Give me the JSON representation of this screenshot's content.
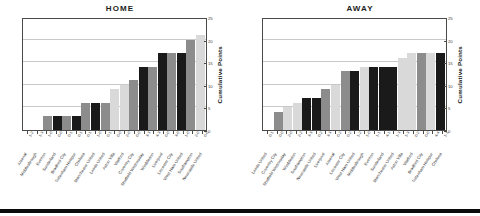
{
  "colors": {
    "bar_gray": "#8c8c8c",
    "bar_black": "#1a1a1a",
    "bar_light": "#d9d9d9",
    "axis": "#4a4a4a",
    "grid": "#c9c9c9",
    "text": "#1d1d1d"
  },
  "axis": {
    "y_label": "Cumulative Points",
    "y_ticks": [
      "0",
      "5",
      "10",
      "15",
      "20",
      "25"
    ]
  },
  "chart_data": [
    {
      "type": "bar",
      "title": "HOME",
      "xlabel": "",
      "ylabel": "Cumulative Points",
      "ylim": [
        0,
        25
      ],
      "grid": true,
      "legend": "none",
      "categories": [
        "Arsenal",
        "Middlesbrough",
        "Everton",
        "Sunderland",
        "Bradford City",
        "Tottenham Hotspur",
        "Chelsea",
        "Manchester United",
        "Leeds United",
        "Aston Villa",
        "Watford",
        "Coventry City",
        "Sheffield Wednesday",
        "Wimbledon",
        "Liverpool",
        "Leicester City",
        "West Ham United",
        "Southampton",
        "Newcastle United"
      ],
      "scores": [
        "1-2",
        "1-3",
        "1-0",
        "0-0",
        "0-1",
        "0-1",
        "0-1",
        "1-0",
        "0-1",
        "0-0",
        "2-0",
        "0-0",
        "3-3",
        "4-3",
        "0-0",
        "3-0",
        "1-0",
        "2-0",
        "0-0"
      ],
      "values": [
        0,
        0,
        3,
        3,
        3,
        3,
        6,
        6,
        6,
        9,
        10,
        11,
        14,
        14,
        17,
        17,
        17,
        20,
        21
      ],
      "bar_colors": [
        "bar_gray",
        "bar_black",
        "bar_gray",
        "bar_black",
        "bar_gray",
        "bar_black",
        "bar_gray",
        "bar_black",
        "bar_gray",
        "bar_light",
        "bar_light",
        "bar_gray",
        "bar_black",
        "bar_gray",
        "bar_black",
        "bar_gray",
        "bar_black",
        "bar_gray",
        "bar_light"
      ]
    },
    {
      "type": "bar",
      "title": "AWAY",
      "xlabel": "",
      "ylabel": "Cumulative Points",
      "ylim": [
        0,
        25
      ],
      "grid": true,
      "legend": "none",
      "categories": [
        "Leeds United",
        "Coventry City",
        "Sheffield Wednesday",
        "Wimbledon",
        "Southampton",
        "Newcastle United",
        "Liverpool",
        "Arsenal",
        "Leicester City",
        "West Ham United",
        "Middlesbrough",
        "Everton",
        "Sunderland",
        "Manchester United",
        "Aston Villa",
        "Watford",
        "Bradford City",
        "Tottenham Hotspur",
        "Chelsea"
      ],
      "scores": [
        "0-1",
        "0-0",
        "2-0",
        "2-2",
        "3-3",
        "0-2",
        "3-3",
        "0-2",
        "0-2",
        "1-2",
        "1-0",
        "1-1",
        "4-1",
        "1-3",
        "1-3",
        "0-2",
        "0-0",
        "4-4",
        "1-1",
        "0-4"
      ],
      "values": [
        0,
        4,
        5,
        6,
        7,
        7,
        9,
        10,
        13,
        13,
        14,
        14,
        14,
        14,
        16,
        17,
        17,
        17,
        17
      ],
      "bar_colors": [
        "bar_black",
        "bar_gray",
        "bar_light",
        "bar_light",
        "bar_black",
        "bar_black",
        "bar_gray",
        "bar_light",
        "bar_gray",
        "bar_black",
        "bar_light",
        "bar_black",
        "bar_black",
        "bar_black",
        "bar_light",
        "bar_light",
        "bar_gray",
        "bar_light",
        "bar_black"
      ]
    }
  ]
}
